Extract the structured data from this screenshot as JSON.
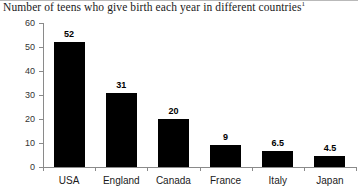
{
  "chart_data": {
    "type": "bar",
    "title": "Number of teens who give birth each year in different countries",
    "title_footnote_marker": "1",
    "xlabel": "",
    "ylabel": "",
    "categories": [
      "USA",
      "England",
      "Canada",
      "France",
      "Italy",
      "Japan"
    ],
    "values": [
      52,
      31,
      20,
      9,
      6.5,
      4.5
    ],
    "value_labels": [
      "52",
      "31",
      "20",
      "9",
      "6.5",
      "4.5"
    ],
    "ylim": [
      0,
      60
    ],
    "yticks": [
      0,
      10,
      20,
      30,
      40,
      50,
      60
    ],
    "ytick_labels": [
      "0",
      "10",
      "20",
      "30",
      "40",
      "50",
      "60"
    ],
    "grid": false,
    "legend": false,
    "bar_color": "#000000",
    "axis_color": "#8a8a8a"
  }
}
